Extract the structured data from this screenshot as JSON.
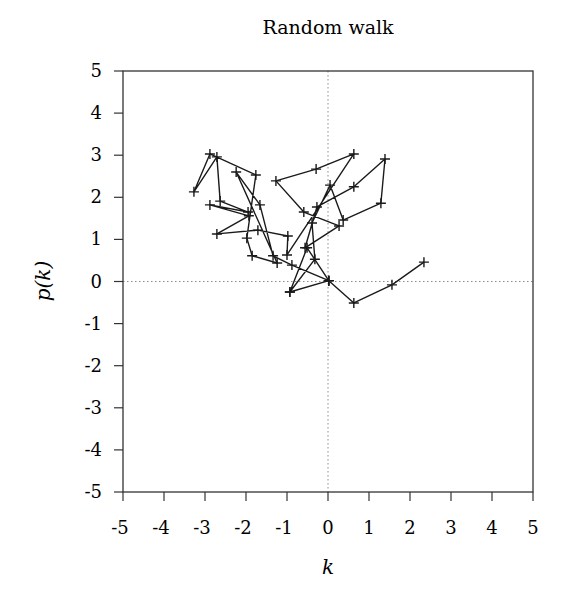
{
  "chart_data": {
    "type": "line",
    "title": "Random walk",
    "xlabel": "k",
    "ylabel": "p(k)",
    "xlim": [
      -5,
      5
    ],
    "ylim": [
      -5,
      5
    ],
    "xticks": [
      -5,
      -4,
      -3,
      -2,
      -1,
      0,
      1,
      2,
      3,
      4,
      5
    ],
    "yticks": [
      -5,
      -4,
      -3,
      -2,
      -1,
      0,
      1,
      2,
      3,
      4,
      5
    ],
    "grid": false,
    "zero_lines": true,
    "marker": "+",
    "legend": null,
    "series": [
      {
        "name": "random walk",
        "x": [
          0.0,
          -0.93,
          0.02,
          -1.24,
          -1.34,
          -1.95,
          -2.24,
          -1.85,
          -1.0,
          -0.88,
          0.0,
          0.63,
          1.56,
          2.34
        ],
        "y": [
          0.02,
          -0.25,
          0.04,
          0.44,
          0.61,
          1.65,
          2.6,
          0.61,
          0.63,
          0.39,
          0.02,
          -0.51,
          -0.08,
          0.46
        ]
      }
    ],
    "points": [
      {
        "k": 0.02,
        "p": 0.02
      },
      {
        "k": -0.93,
        "p": -0.25
      },
      {
        "k": -0.32,
        "p": 0.53
      },
      {
        "k": -0.39,
        "p": 1.39
      },
      {
        "k": 0.05,
        "p": 2.29
      },
      {
        "k": 0.37,
        "p": 1.46
      },
      {
        "k": 1.29,
        "p": 1.86
      },
      {
        "k": 1.39,
        "p": 2.91
      },
      {
        "k": 0.63,
        "p": 2.25
      },
      {
        "k": -0.27,
        "p": 1.77
      },
      {
        "k": -0.56,
        "p": 0.8
      },
      {
        "k": 0.27,
        "p": 1.32
      },
      {
        "k": -0.59,
        "p": 1.65
      },
      {
        "k": -1.27,
        "p": 2.39
      },
      {
        "k": -0.29,
        "p": 2.67
      },
      {
        "k": 0.63,
        "p": 3.03
      },
      {
        "k": -1.0,
        "p": 0.63
      },
      {
        "k": -0.98,
        "p": 1.08
      },
      {
        "k": -1.71,
        "p": 1.22
      },
      {
        "k": -2.71,
        "p": 1.13
      },
      {
        "k": -1.93,
        "p": 1.56
      },
      {
        "k": -2.88,
        "p": 1.82
      },
      {
        "k": -1.95,
        "p": 1.65
      },
      {
        "k": -2.63,
        "p": 1.91
      },
      {
        "k": -2.71,
        "p": 2.96
      },
      {
        "k": -3.27,
        "p": 2.13
      },
      {
        "k": -2.88,
        "p": 3.03
      },
      {
        "k": -1.76,
        "p": 2.53
      },
      {
        "k": -1.98,
        "p": 1.03
      },
      {
        "k": -1.85,
        "p": 0.61
      },
      {
        "k": -1.24,
        "p": 0.44
      },
      {
        "k": -2.24,
        "p": 2.6
      },
      {
        "k": -1.66,
        "p": 1.82
      },
      {
        "k": -1.34,
        "p": 0.61
      },
      {
        "k": -0.88,
        "p": 0.39
      },
      {
        "k": 0.02,
        "p": 0.02
      },
      {
        "k": -0.93,
        "p": -0.25
      },
      {
        "k": -0.51,
        "p": 0.8
      },
      {
        "k": 0.02,
        "p": 0.02
      },
      {
        "k": 0.63,
        "p": -0.51
      },
      {
        "k": 1.56,
        "p": -0.08
      },
      {
        "k": 2.34,
        "p": 0.46
      }
    ]
  },
  "colors": {
    "line": "#1a1a1a",
    "axis": "#333333",
    "zero_line": "#8a8a8a",
    "background": "#ffffff"
  }
}
